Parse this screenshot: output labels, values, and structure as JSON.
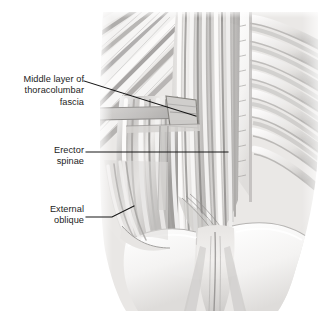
{
  "figure": {
    "style": "grayscale medical illustration",
    "background_color": "#ffffff",
    "leader_line_color": "#1a1a1a",
    "text_color": "#1c1c1c"
  },
  "labels": [
    {
      "id": "middle-layer-thoracolumbar-fascia",
      "lines": [
        "Middle layer of",
        "thoracolumbar",
        "fascia"
      ],
      "line1": "Middle layer of",
      "line2": "thoracolumbar",
      "line3": "fascia",
      "align": "right",
      "leader": "diagonal"
    },
    {
      "id": "erector-spinae",
      "lines": [
        "Erector",
        "spinae"
      ],
      "line1": "Erector",
      "line2": "spinae",
      "align": "right",
      "leader": "horizontal"
    },
    {
      "id": "external-oblique",
      "lines": [
        "External",
        "oblique"
      ],
      "line1": "External",
      "line2": "oblique",
      "align": "right",
      "leader": "elbow-up"
    }
  ],
  "anatomy_parts": [
    "erector spinae muscle",
    "middle layer of thoracolumbar fascia",
    "external oblique muscle",
    "ribs",
    "vertebral spinous processes",
    "iliac crest",
    "sacrum",
    "ilium"
  ],
  "palette": {
    "muscle_light": "#e8e6e4",
    "muscle_mid": "#b9b7b5",
    "muscle_dark": "#8a8886",
    "muscle_darkest": "#5f5d5c",
    "bone_light": "#f6f5f4",
    "bone_shadow": "#d8d6d4",
    "fascia": "#c9c7c5",
    "outline": "#9a9896"
  }
}
